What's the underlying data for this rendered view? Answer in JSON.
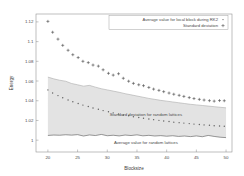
{
  "chart_data": {
    "type": "scatter",
    "title": "",
    "xlabel": "Blocksize",
    "ylabel": "Energy",
    "xlim": [
      18,
      51
    ],
    "ylim": [
      0.988,
      1.128
    ],
    "xticks": [
      20,
      25,
      30,
      35,
      40,
      45,
      50
    ],
    "xtick_labels": [
      "20",
      "25",
      "30",
      "35",
      "40",
      "45",
      "50"
    ],
    "yticks": [
      1.0,
      1.02,
      1.04,
      1.06,
      1.08,
      1.1,
      1.12
    ],
    "ytick_labels": [
      "1",
      "1.02",
      "1.04",
      "1.06",
      "1.08",
      "1.1",
      "1.12"
    ],
    "grid": false,
    "legend_position": "top-right",
    "legend": [
      {
        "label": "Average value for local block during RK2",
        "marker": "dot"
      },
      {
        "label": "Standard deviation",
        "marker": "plus"
      }
    ],
    "annotations": [
      {
        "text": "Standard deviation for random lattices",
        "x": 36.5,
        "y": 1.0245
      },
      {
        "text": "Average value for random lattices",
        "x": 36.5,
        "y": 0.9965
      }
    ],
    "series": [
      {
        "name": "Average value for local block during RK2",
        "type": "scatter",
        "marker": "plus",
        "color": "#3c3c3c",
        "x": [
          20,
          20.8,
          21.7,
          22.5,
          23.4,
          24.2,
          25.1,
          25.9,
          26.8,
          27.6,
          28.5,
          29.3,
          30.2,
          31.0,
          31.9,
          32.7,
          33.6,
          34.4,
          35.3,
          36.1,
          37.0,
          37.8,
          38.7,
          39.5,
          40.4,
          41.2,
          42.1,
          42.9,
          43.8,
          44.6,
          45.5,
          46.3,
          47.2,
          48.0,
          48.9,
          49.7
        ],
        "y": [
          1.1205,
          1.1095,
          1.1025,
          1.0962,
          1.0912,
          1.0867,
          1.0838,
          1.08,
          1.0787,
          1.0762,
          1.0751,
          1.0714,
          1.0678,
          1.066,
          1.0674,
          1.0628,
          1.0598,
          1.0576,
          1.0562,
          1.0553,
          1.0535,
          1.0518,
          1.0505,
          1.0492,
          1.0478,
          1.0466,
          1.0455,
          1.0444,
          1.0432,
          1.0422,
          1.0414,
          1.0407,
          1.0401,
          1.0396,
          1.0402,
          1.04
        ]
      },
      {
        "name": "Standard deviation",
        "type": "scatter",
        "marker": "dot",
        "color": "#606060",
        "x": [
          20,
          20.8,
          21.7,
          22.5,
          23.4,
          24.2,
          25.1,
          25.9,
          26.8,
          27.6,
          28.5,
          29.3,
          30.2,
          31.0,
          31.9,
          32.7,
          33.6,
          34.4,
          35.3,
          36.1,
          37.0,
          37.8,
          38.7,
          39.5,
          40.4,
          41.2,
          42.1,
          42.9,
          43.8,
          44.6,
          45.5,
          46.3,
          47.2,
          48.0,
          48.9,
          49.7
        ],
        "y": [
          1.051,
          1.0478,
          1.0452,
          1.043,
          1.0408,
          1.039,
          1.0372,
          1.0356,
          1.0341,
          1.0327,
          1.0313,
          1.03,
          1.0288,
          1.0277,
          1.0266,
          1.0256,
          1.0247,
          1.0238,
          1.023,
          1.0222,
          1.0215,
          1.0208,
          1.0201,
          1.0195,
          1.0189,
          1.0183,
          1.0178,
          1.0173,
          1.0168,
          1.0163,
          1.0159,
          1.0155,
          1.0151,
          1.0147,
          1.0144,
          1.0141
        ]
      },
      {
        "name": "Average value for random lattices",
        "type": "line",
        "color": "#555555",
        "x": [
          20,
          21,
          22,
          23,
          24,
          25,
          26,
          27,
          28,
          29,
          30,
          31,
          32,
          33,
          34,
          35,
          36,
          37,
          38,
          39,
          40,
          41,
          42,
          43,
          44,
          45,
          46,
          47,
          48,
          49,
          50
        ],
        "y": [
          1.0048,
          1.0052,
          1.005,
          1.0055,
          1.0051,
          1.0056,
          1.0042,
          1.0053,
          1.0047,
          1.0058,
          1.0045,
          1.005,
          1.0043,
          1.0052,
          1.0047,
          1.0054,
          1.0044,
          1.0049,
          1.0042,
          1.0046,
          1.004,
          1.0045,
          1.0038,
          1.0042,
          1.0036,
          1.0043,
          1.0035,
          1.0048,
          1.0038,
          1.003,
          1.0026
        ]
      },
      {
        "name": "Standard deviation for random lattices (band upper)",
        "type": "line",
        "color": "#9e9e9e",
        "x": [
          20,
          21,
          22,
          23,
          24,
          25,
          26,
          27,
          28,
          29,
          30,
          31,
          32,
          33,
          34,
          35,
          36,
          37,
          38,
          39,
          40,
          41,
          42,
          43,
          44,
          45,
          46,
          47,
          48,
          49,
          50
        ],
        "y": [
          1.064,
          1.0622,
          1.0608,
          1.0598,
          1.0575,
          1.0562,
          1.0548,
          1.0556,
          1.0538,
          1.0522,
          1.051,
          1.0498,
          1.0486,
          1.0472,
          1.046,
          1.0448,
          1.0436,
          1.0424,
          1.0414,
          1.0404,
          1.0396,
          1.0388,
          1.038,
          1.0372,
          1.0364,
          1.0358,
          1.0352,
          1.0346,
          1.034,
          1.0334,
          1.0328
        ]
      }
    ]
  }
}
